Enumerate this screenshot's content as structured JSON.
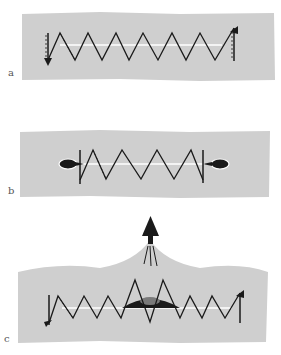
{
  "figure": {
    "colors": {
      "background": "#ffffff",
      "panel": "#cfcfcf",
      "stroke": "#1a1a1a",
      "axis_line": "#ffffff",
      "label": "#555555"
    },
    "panels": [
      {
        "id": "a",
        "label": "a",
        "description": "Helix wound around a straight line segment with closing loops at both ends",
        "helix_turns": 7,
        "end_features": "end loops with arrows"
      },
      {
        "id": "b",
        "label": "b",
        "description": "Helix around a line with teardrop-shaped blobs at each end",
        "helix_turns": 4,
        "end_features": "teardrop blobs"
      },
      {
        "id": "c",
        "label": "c",
        "description": "Helix with a central dark bulge and an upward arrow emerging from a peaked shape",
        "helix_turns": 11,
        "end_features": "end loops with arrows",
        "center_feature": "dark mound at center",
        "arrow": "upward thick arrow with three thin lines"
      }
    ]
  }
}
